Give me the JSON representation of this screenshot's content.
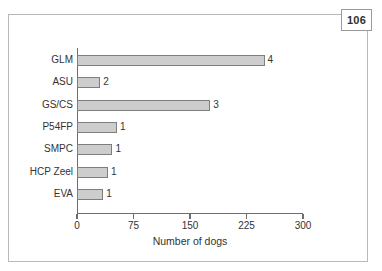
{
  "page_badge": {
    "number": "106"
  },
  "chart_data": {
    "type": "bar",
    "orientation": "horizontal",
    "title": "",
    "xlabel": "Number of dogs",
    "ylabel": "",
    "categories": [
      "GLM",
      "ASU",
      "GS/CS",
      "P54FP",
      "SMPC",
      "HCP Zeel",
      "EVA"
    ],
    "values": [
      249,
      31,
      177,
      53,
      47,
      41,
      35
    ],
    "data_labels": [
      "4",
      "2",
      "3",
      "1",
      "1",
      "1",
      "1"
    ],
    "xlim": [
      0,
      300
    ],
    "xticks": [
      0,
      75,
      150,
      225,
      300
    ],
    "xtick_labels": [
      "0",
      "75",
      "150",
      "225",
      "300"
    ],
    "grid": false,
    "legend": null,
    "bar_fill": "#cdcdcd",
    "bar_edge": "#7e7e7e",
    "axis_color": "#6e6e6e"
  }
}
